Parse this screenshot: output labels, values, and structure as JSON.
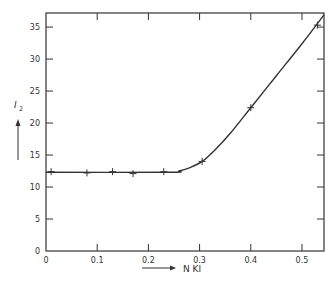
{
  "chart_data": {
    "type": "line",
    "title": "",
    "xlabel": "N KI",
    "ylabel": "I2",
    "xlim": [
      0,
      0.543
    ],
    "ylim": [
      0,
      37.2
    ],
    "x_ticks": [
      "0",
      "0.1",
      "0.2",
      "0.3",
      "0.4",
      "0.5"
    ],
    "y_ticks": [
      "0",
      "5",
      "10",
      "15",
      "20",
      "25",
      "30",
      "35"
    ],
    "grid": false,
    "legend": null,
    "series": [
      {
        "name": "I2 vs N KI",
        "marker": "+",
        "points": [
          {
            "x": 0.01,
            "y": 12.4
          },
          {
            "x": 0.08,
            "y": 12.2
          },
          {
            "x": 0.13,
            "y": 12.4
          },
          {
            "x": 0.17,
            "y": 12.1
          },
          {
            "x": 0.23,
            "y": 12.4
          },
          {
            "x": 0.305,
            "y": 14.0
          },
          {
            "x": 0.4,
            "y": 22.4
          },
          {
            "x": 0.53,
            "y": 35.3
          }
        ]
      }
    ],
    "curve": [
      [
        0.0,
        12.3
      ],
      [
        0.24,
        12.3
      ],
      [
        0.26,
        12.5
      ],
      [
        0.28,
        13.0
      ],
      [
        0.305,
        14.0
      ],
      [
        0.33,
        15.8
      ],
      [
        0.36,
        18.4
      ],
      [
        0.4,
        22.4
      ],
      [
        0.45,
        27.4
      ],
      [
        0.5,
        32.4
      ],
      [
        0.543,
        36.9
      ]
    ]
  },
  "colors": {
    "ink": "#333333",
    "background": "#ffffff"
  }
}
